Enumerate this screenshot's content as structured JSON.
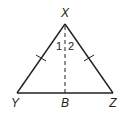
{
  "diagram": {
    "type": "geometry-triangle",
    "stroke_color": "#231f20",
    "vertices": {
      "X": {
        "label": "X",
        "x": 65,
        "y": 24
      },
      "Y": {
        "label": "Y",
        "x": 17,
        "y": 93
      },
      "Z": {
        "label": "Z",
        "x": 113,
        "y": 93
      },
      "B": {
        "label": "B",
        "x": 65,
        "y": 93
      }
    },
    "segments": [
      {
        "from": "X",
        "to": "Y",
        "style": "solid",
        "tick_marks": 1
      },
      {
        "from": "X",
        "to": "Z",
        "style": "solid",
        "tick_marks": 1
      },
      {
        "from": "Y",
        "to": "Z",
        "style": "solid",
        "tick_marks": 0
      },
      {
        "from": "X",
        "to": "B",
        "style": "dashed",
        "tick_marks": 0
      }
    ],
    "angle_labels": [
      {
        "label": "1",
        "position": "left of XB at X"
      },
      {
        "label": "2",
        "position": "right of XB at X"
      }
    ]
  }
}
